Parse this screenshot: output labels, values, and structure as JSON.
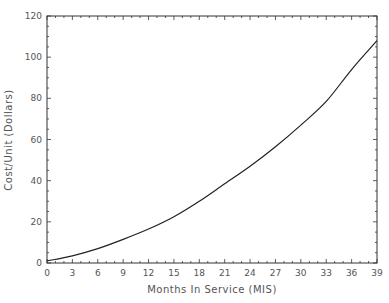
{
  "chart_data": {
    "type": "line",
    "title": "",
    "xlabel": "Months In Service (MIS)",
    "ylabel": "Cost/Unit (Dollars)",
    "xlim": [
      0,
      39
    ],
    "ylim": [
      0,
      120
    ],
    "x_ticks": [
      0,
      3,
      6,
      9,
      12,
      15,
      18,
      21,
      24,
      27,
      30,
      33,
      36,
      39
    ],
    "y_ticks": [
      0,
      20,
      40,
      60,
      80,
      100,
      120
    ],
    "grid": false,
    "legend": null,
    "series": [
      {
        "name": "Cost/Unit",
        "x": [
          0,
          3,
          6,
          9,
          12,
          15,
          18,
          21,
          24,
          27,
          30,
          33,
          36,
          39
        ],
        "values": [
          1,
          3.5,
          7,
          11.5,
          16.5,
          22.5,
          30,
          38.5,
          47,
          56.5,
          67,
          78.5,
          94,
          108
        ]
      }
    ]
  },
  "labels": {
    "xlabel": "Months In Service (MIS)",
    "ylabel": "Cost/Unit (Dollars)"
  }
}
